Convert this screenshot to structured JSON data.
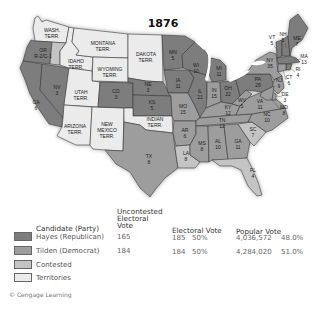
{
  "map": {
    "title": "1876",
    "colors": {
      "republican": "#7d7d7d",
      "democrat": "#9d9d9d",
      "contested": "#c4c4c4",
      "territories": "#ebebeb"
    },
    "states": {
      "wa": {
        "l1": "WASH.",
        "l2": "TERR."
      },
      "or": {
        "l1": "OR",
        "l2": "R-2/C-1"
      },
      "ca": {
        "l1": "CA",
        "l2": "6"
      },
      "nv": {
        "l1": "NV",
        "l2": "3"
      },
      "id": {
        "l1": "IDAHO",
        "l2": "TERR."
      },
      "mt": {
        "l1": "MONTANA",
        "l2": "TERR."
      },
      "wy": {
        "l1": "WYOMING",
        "l2": "TERR."
      },
      "ut": {
        "l1": "UTAH",
        "l2": "TERR."
      },
      "az": {
        "l1": "ARIZONA",
        "l2": "TERR."
      },
      "nm": {
        "l1": "NEW",
        "l2": "MEXICO",
        "l3": "TERR."
      },
      "co": {
        "l1": "CO",
        "l2": "3"
      },
      "dk": {
        "l1": "DAKOTA",
        "l2": "TERR."
      },
      "ne": {
        "l1": "NE",
        "l2": "3"
      },
      "ks": {
        "l1": "KS",
        "l2": "5"
      },
      "it": {
        "l1": "INDIAN",
        "l2": "TERR."
      },
      "tx": {
        "l1": "TX",
        "l2": "8"
      },
      "mn": {
        "l1": "MN",
        "l2": "5"
      },
      "ia": {
        "l1": "IA",
        "l2": "11"
      },
      "mo": {
        "l1": "MO",
        "l2": "15"
      },
      "ar": {
        "l1": "AR",
        "l2": "6"
      },
      "la": {
        "l1": "LA",
        "l2": "8"
      },
      "wi": {
        "l1": "WI",
        "l2": "10"
      },
      "il": {
        "l1": "IL",
        "l2": "21"
      },
      "mi": {
        "l1": "MI",
        "l2": "11"
      },
      "in": {
        "l1": "IN",
        "l2": "15"
      },
      "oh": {
        "l1": "OH",
        "l2": "22"
      },
      "ky": {
        "l1": "KY",
        "l2": "12"
      },
      "tn": {
        "l1": "TN",
        "l2": "12"
      },
      "ms": {
        "l1": "MS",
        "l2": "8"
      },
      "al": {
        "l1": "AL",
        "l2": "10"
      },
      "ga": {
        "l1": "GA",
        "l2": "11"
      },
      "fl": {
        "l1": "FL",
        "l2": "4"
      },
      "sc": {
        "l1": "SC",
        "l2": "7"
      },
      "nc": {
        "l1": "NC",
        "l2": "10"
      },
      "va": {
        "l1": "VA",
        "l2": "11"
      },
      "wv": {
        "l1": "WV",
        "l2": "5"
      },
      "pa": {
        "l1": "PA",
        "l2": "29"
      },
      "ny": {
        "l1": "NY",
        "l2": "35"
      },
      "vt": {
        "l1": "VT",
        "l2": "5"
      },
      "nh": {
        "l1": "NH",
        "l2": "5"
      },
      "me": {
        "l1": "ME",
        "l2": "7"
      },
      "ma": {
        "l1": "MA",
        "l2": "13"
      },
      "ri": {
        "l1": "RI",
        "l2": "4"
      },
      "ct": {
        "l1": "CT",
        "l2": "6"
      },
      "nj": {
        "l1": "NJ",
        "l2": "9"
      },
      "de": {
        "l1": "DE",
        "l2": "3"
      },
      "md": {
        "l1": "MD",
        "l2": "8"
      }
    }
  },
  "legend": {
    "headers": {
      "candidate": "Candidate (Party)",
      "uncontested_1": "Uncontested",
      "uncontested_2": "Electoral",
      "uncontested_3": "Vote",
      "electoral": "Electoral Vote",
      "popular": "Popular Vote"
    },
    "rows": [
      {
        "label": "Hayes (Republican)",
        "uncontested": "165",
        "ev": "185",
        "ev_pct": "50%",
        "pv": "4,036,572",
        "pv_pct": "48.0%"
      },
      {
        "label": "Tilden (Democrat)",
        "uncontested": "184",
        "ev": "184",
        "ev_pct": "50%",
        "pv": "4,284,020",
        "pv_pct": "51.0%"
      },
      {
        "label": "Contested"
      },
      {
        "label": "Territories"
      }
    ]
  },
  "credit": "© Cengage Learning"
}
